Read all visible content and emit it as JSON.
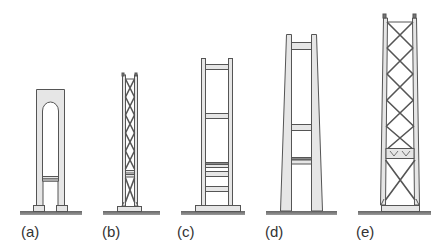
{
  "figure": {
    "colors": {
      "fill": "#e6e6e6",
      "stroke": "#555555",
      "ground": "#777777",
      "label": "#333333"
    },
    "towers": [
      {
        "id": "a",
        "label": "(a)",
        "type": "portal-arch"
      },
      {
        "id": "b",
        "label": "(b)",
        "type": "x-braced-truss"
      },
      {
        "id": "c",
        "label": "(c)",
        "type": "rigid-frame-ladder"
      },
      {
        "id": "d",
        "label": "(d)",
        "type": "tapered-rigid-frame"
      },
      {
        "id": "e",
        "label": "(e)",
        "type": "tall-x-braced-truss"
      }
    ]
  }
}
